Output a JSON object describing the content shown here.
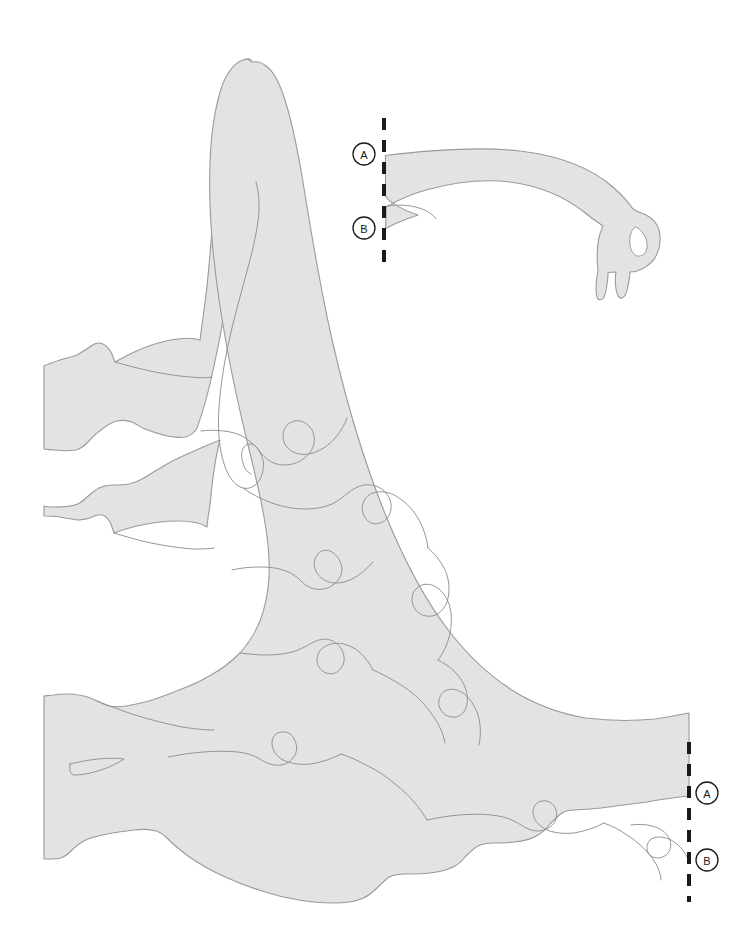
{
  "document": {
    "title": "Dinosaur Jigsaw Puzzle Assembly Diagram",
    "type": "line-art-diagram"
  },
  "colors": {
    "background": "#ffffff",
    "piece_fill": "#e3e3e3",
    "piece_stroke": "#9a9a9a",
    "interior_cut_stroke": "#8f8f8f",
    "marker_stroke": "#1a1a1a",
    "marker_text": "#1a1a1a",
    "dash_line": "#1a1a1a"
  },
  "parts": [
    {
      "id": "body",
      "name": "body-assembly",
      "label": "Assembled dinosaur body with tail, legs and interlocking jigsaw pieces"
    },
    {
      "id": "neck",
      "name": "neck-head-piece",
      "label": "Detached neck and head puzzle piece"
    }
  ],
  "markers": [
    {
      "id": "neck-a",
      "letter": "A",
      "name": "marker-a-neck",
      "x": 364,
      "y": 154,
      "attaches_to": "body-a"
    },
    {
      "id": "neck-b",
      "letter": "B",
      "name": "marker-b-neck",
      "x": 364,
      "y": 228,
      "attaches_to": "body-b"
    },
    {
      "id": "body-a",
      "letter": "A",
      "name": "marker-a-body",
      "x": 707,
      "y": 793,
      "attaches_to": "neck-a"
    },
    {
      "id": "body-b",
      "letter": "B",
      "name": "marker-b-body",
      "x": 707,
      "y": 860,
      "attaches_to": "neck-b"
    }
  ],
  "cut_lines": [
    {
      "id": "neck-cut",
      "name": "dashed-cut-line-neck",
      "x": 384,
      "y_start": 118,
      "y_end": 262,
      "style": "dashed"
    },
    {
      "id": "body-cut",
      "name": "dashed-cut-line-body",
      "x": 689,
      "y_start": 742,
      "y_end": 902,
      "style": "dashed"
    }
  ],
  "dash_pattern": {
    "dash": 12,
    "gap": 10,
    "width": 4
  },
  "marker_style": {
    "radius": 11,
    "stroke_width": 1.3,
    "font_size": 11
  }
}
